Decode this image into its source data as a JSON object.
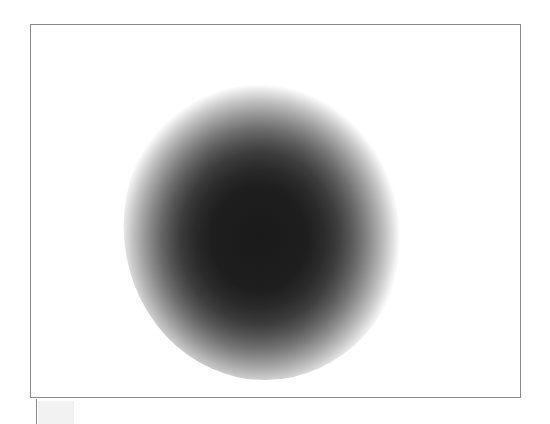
{
  "figure": {
    "title": "",
    "panel_label": "plot-panel",
    "background_color": "#ffffff",
    "border_color": "#8a8a8a",
    "border_width_px": 1,
    "panel": {
      "x": 30,
      "y": 24,
      "width": 491,
      "height": 374
    }
  },
  "marks": {
    "corner_tick_label": "",
    "corner_swatch_label": "",
    "corner_swatch_color": "#f2f2f2",
    "corner_tick_color": "#8a8a8a"
  },
  "chart_data": {
    "type": "heatmap",
    "title": "",
    "subtitle": "",
    "xlabel": "",
    "ylabel": "",
    "legend": [],
    "annotations": [],
    "grid": false,
    "axes_visible": false,
    "tick_labels_x": [],
    "tick_labels_y": [],
    "xlim": [
      0,
      491
    ],
    "ylim": [
      0,
      374
    ],
    "description": "Single circularly symmetric dark blob (radial intensity profile) on a white field inside a thin gray rectangular frame.",
    "colormap": "grayscale-inverted",
    "colormap_stops": [
      {
        "radius_fraction": 0.0,
        "color": "#1a1a1a",
        "intensity": 1.0
      },
      {
        "radius_fraction": 0.34,
        "color": "#1e1e1e",
        "intensity": 0.98
      },
      {
        "radius_fraction": 0.46,
        "color": "#2b2b2b",
        "intensity": 0.93
      },
      {
        "radius_fraction": 0.56,
        "color": "#3d3d3d",
        "intensity": 0.85
      },
      {
        "radius_fraction": 0.64,
        "color": "#555555",
        "intensity": 0.74
      },
      {
        "radius_fraction": 0.71,
        "color": "#6e6e6e",
        "intensity": 0.61
      },
      {
        "radius_fraction": 0.78,
        "color": "#8c8c8c",
        "intensity": 0.47
      },
      {
        "radius_fraction": 0.84,
        "color": "#a8a8a8",
        "intensity": 0.34
      },
      {
        "radius_fraction": 0.9,
        "color": "#c6c6c6",
        "intensity": 0.22
      },
      {
        "radius_fraction": 0.95,
        "color": "#e2e2e2",
        "intensity": 0.11
      },
      {
        "radius_fraction": 1.0,
        "color": "#ffffff",
        "intensity": 0.0
      }
    ],
    "blob": {
      "center_x_px": 265,
      "center_y_px": 226,
      "radius_x_px": 142,
      "radius_y_px": 155,
      "core_min_gray": "#1a1a1a",
      "halo_max_gray": "#ffffff",
      "peak_intensity": 1.0,
      "shape": "ellipse",
      "rendering": "halftone-dither"
    },
    "radial_profile": {
      "r_px": [
        0,
        20,
        40,
        60,
        80,
        95,
        110,
        120,
        130,
        140,
        150,
        160
      ],
      "intensity": [
        1.0,
        1.0,
        0.99,
        0.96,
        0.88,
        0.78,
        0.6,
        0.45,
        0.28,
        0.14,
        0.05,
        0.0
      ]
    }
  }
}
